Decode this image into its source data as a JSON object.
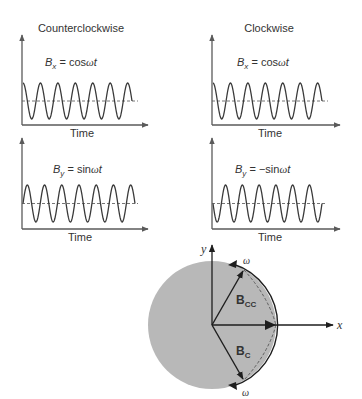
{
  "columns": [
    {
      "title": "Counterclockwise"
    },
    {
      "title": "Clockwise"
    }
  ],
  "panels": [
    {
      "id": "ccw-bx",
      "sym": "B",
      "sub": "x",
      "eq": " = cos",
      "w": "ω",
      "t": "t",
      "func": "cos",
      "x_label": "Time"
    },
    {
      "id": "cw-bx",
      "sym": "B",
      "sub": "x",
      "eq": " = cos",
      "w": "ω",
      "t": "t",
      "func": "cos",
      "x_label": "Time"
    },
    {
      "id": "ccw-by",
      "sym": "B",
      "sub": "y",
      "eq": " = sin",
      "w": "ω",
      "t": "t",
      "func": "sin",
      "x_label": "Time"
    },
    {
      "id": "cw-by",
      "sym": "B",
      "sub": "y",
      "eq": " = −sin",
      "w": "ω",
      "t": "t",
      "func": "-sin",
      "x_label": "Time"
    }
  ],
  "phasor": {
    "x_axis_label": "x",
    "y_axis_label": "y",
    "vector_cc": {
      "main": "B",
      "sub": "CC",
      "angle_deg": 60
    },
    "vector_c": {
      "main": "B",
      "sub": "C",
      "angle_deg": -60
    },
    "omega_label": "ω"
  },
  "colors": {
    "wave": "#3a3a3a",
    "axis": "#5a5a5a",
    "dashed": "#666666",
    "disk": "#b8b8b8",
    "vector": "#1e1e1e"
  },
  "chart_data": [
    {
      "type": "line",
      "title": "Counterclockwise: Bx = cos ωt",
      "xlabel": "Time",
      "ylabel": "",
      "function": "cos",
      "cycles": 6.25
    },
    {
      "type": "line",
      "title": "Clockwise: Bx = cos ωt",
      "xlabel": "Time",
      "ylabel": "",
      "function": "cos",
      "cycles": 6.25
    },
    {
      "type": "line",
      "title": "Counterclockwise: By = sin ωt",
      "xlabel": "Time",
      "ylabel": "",
      "function": "sin",
      "cycles": 6.5
    },
    {
      "type": "line",
      "title": "Clockwise: By = −sin ωt",
      "xlabel": "Time",
      "ylabel": "",
      "function": "-sin",
      "cycles": 6.5
    }
  ]
}
